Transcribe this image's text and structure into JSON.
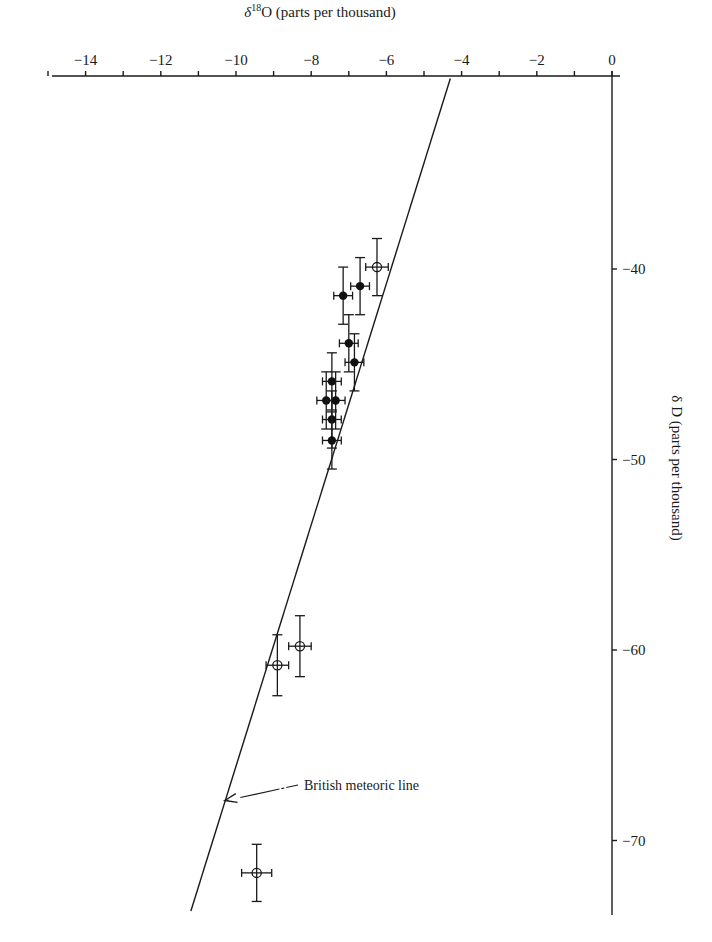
{
  "chart_data": {
    "type": "scatter",
    "title": "",
    "xlabel": "δ¹⁸O (parts per thousand)",
    "xlabel_parts": {
      "delta": "δ",
      "sup": "18",
      "rest": "O (parts per thousand)"
    },
    "ylabel": "δ D (parts per thousand)",
    "x_axis_position": "top",
    "y_axis_position": "right",
    "xlim": [
      -15,
      0
    ],
    "ylim": [
      -74,
      -30
    ],
    "x_ticks": [
      -14,
      -12,
      -10,
      -8,
      -6,
      -4,
      -2,
      0
    ],
    "x_tick_labels": [
      "−14",
      "−12",
      "−10",
      "−8",
      "−6",
      "−4",
      "−2",
      "0"
    ],
    "x_minor_ticks": [
      -15,
      -13,
      -11,
      -9,
      -7,
      -5,
      -3,
      -1
    ],
    "y_ticks": [
      -40,
      -50,
      -60,
      -70
    ],
    "y_tick_labels": [
      "−40",
      "−50",
      "−60",
      "−70"
    ],
    "grid": false,
    "legend": null,
    "series": [
      {
        "name": "filled samples",
        "marker": "filled-circle",
        "points": [
          {
            "x": -6.7,
            "y": -40.9,
            "xerr": 0.25,
            "yerr": 1.5
          },
          {
            "x": -7.15,
            "y": -41.4,
            "xerr": 0.25,
            "yerr": 1.5
          },
          {
            "x": -7.0,
            "y": -43.9,
            "xerr": 0.25,
            "yerr": 1.5
          },
          {
            "x": -6.85,
            "y": -44.9,
            "xerr": 0.25,
            "yerr": 1.5
          },
          {
            "x": -7.45,
            "y": -45.9,
            "xerr": 0.25,
            "yerr": 1.5
          },
          {
            "x": -7.6,
            "y": -46.9,
            "xerr": 0.25,
            "yerr": 1.5
          },
          {
            "x": -7.35,
            "y": -46.9,
            "xerr": 0.25,
            "yerr": 1.5
          },
          {
            "x": -7.45,
            "y": -47.9,
            "xerr": 0.25,
            "yerr": 1.5
          },
          {
            "x": -7.45,
            "y": -49.0,
            "xerr": 0.25,
            "yerr": 1.5
          }
        ]
      },
      {
        "name": "open samples",
        "marker": "open-circle-cross",
        "points": [
          {
            "x": -6.25,
            "y": -39.9,
            "xerr": 0.3,
            "yerr": 1.5
          },
          {
            "x": -8.3,
            "y": -59.8,
            "xerr": 0.3,
            "yerr": 1.6
          },
          {
            "x": -8.9,
            "y": -60.8,
            "xerr": 0.3,
            "yerr": 1.6
          },
          {
            "x": -9.45,
            "y": -71.7,
            "xerr": 0.4,
            "yerr": 1.5
          }
        ]
      }
    ],
    "reference_line": {
      "name": "British meteoric line",
      "from": {
        "x": -4.3,
        "y": -30.0
      },
      "to": {
        "x": -11.2,
        "y": -73.7
      }
    },
    "annotations": [
      {
        "text": "British meteoric line",
        "arrow_to": {
          "x": -10.3,
          "y": -67.9
        }
      }
    ]
  }
}
